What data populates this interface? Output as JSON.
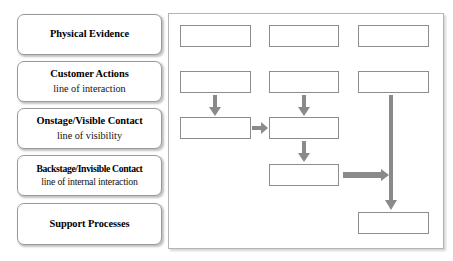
{
  "diagram": {
    "type": "service-blueprint",
    "colors": {
      "box_border": "#8d8d8d",
      "legend_border": "#9a9a9a",
      "panel_border": "#b4b4b4",
      "arrow_fill": "#8a8a8a",
      "background": "#ffffff",
      "text": "#000000"
    },
    "legend_rows": [
      {
        "id": "physical-evidence",
        "title": "Physical Evidence",
        "divider": ""
      },
      {
        "id": "customer-actions",
        "title": "Customer Actions",
        "divider": "line of interaction"
      },
      {
        "id": "onstage-visible-contact",
        "title": "Onstage/Visible Contact",
        "divider": "line of visibility"
      },
      {
        "id": "backstage-invisible-contact",
        "title": "Backstage/Invisible Contact",
        "divider": "line of internal interaction"
      },
      {
        "id": "support-processes",
        "title": "Support Processes",
        "divider": ""
      }
    ],
    "process_nodes": [
      {
        "id": "evidence-1",
        "row": "physical-evidence",
        "column": 1,
        "label": ""
      },
      {
        "id": "evidence-2",
        "row": "physical-evidence",
        "column": 2,
        "label": ""
      },
      {
        "id": "evidence-3",
        "row": "physical-evidence",
        "column": 3,
        "label": ""
      },
      {
        "id": "customer-1",
        "row": "customer-actions",
        "column": 1,
        "label": ""
      },
      {
        "id": "customer-2",
        "row": "customer-actions",
        "column": 2,
        "label": ""
      },
      {
        "id": "customer-3",
        "row": "customer-actions",
        "column": 3,
        "label": ""
      },
      {
        "id": "onstage-1",
        "row": "onstage-visible-contact",
        "column": 1,
        "label": ""
      },
      {
        "id": "onstage-2",
        "row": "onstage-visible-contact",
        "column": 2,
        "label": ""
      },
      {
        "id": "backstage-1",
        "row": "backstage-invisible-contact",
        "column": 2,
        "label": ""
      },
      {
        "id": "support-1",
        "row": "support-processes",
        "column": 3,
        "label": ""
      }
    ],
    "connectors": [
      {
        "id": "down-left",
        "from": "customer-1",
        "to": "onstage-1",
        "direction": "down",
        "style": "short"
      },
      {
        "id": "down-mid",
        "from": "customer-2",
        "to": "onstage-2",
        "direction": "down",
        "style": "short"
      },
      {
        "id": "right-onstage",
        "from": "onstage-1",
        "to": "onstage-2",
        "direction": "right",
        "style": "short"
      },
      {
        "id": "down-backstage",
        "from": "onstage-2",
        "to": "backstage-1",
        "direction": "down",
        "style": "short"
      },
      {
        "id": "right-long",
        "from": "backstage-1",
        "to": "down-long",
        "direction": "right",
        "style": "long"
      },
      {
        "id": "down-long",
        "from": "customer-3",
        "to": "support-1",
        "direction": "down",
        "style": "long"
      }
    ]
  }
}
